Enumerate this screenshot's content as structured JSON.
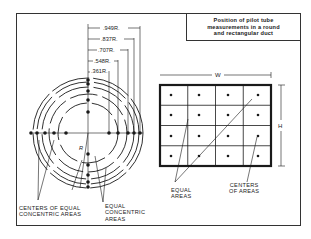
{
  "title": {
    "lines": [
      "Position of pilot tube",
      "measurements in a round",
      "and rectangular duct"
    ]
  },
  "round_duct": {
    "radius_labels": [
      ".949R.",
      ".837R.",
      ".707R.",
      ".548R.",
      ".361R."
    ],
    "center_label": "R",
    "label_centers": [
      "CENTERS OF EQUAL",
      "CONCENTRIC AREAS"
    ],
    "label_areas": [
      "EQUAL",
      "CONCENTRIC",
      "AREAS"
    ]
  },
  "rect_duct": {
    "width_label": "W",
    "height_label": "H",
    "grid": {
      "rows": 4,
      "cols": 4
    },
    "label_equal_areas": [
      "EQUAL",
      "AREAS"
    ],
    "label_centers": [
      "CENTERS",
      "OF AREAS"
    ]
  }
}
